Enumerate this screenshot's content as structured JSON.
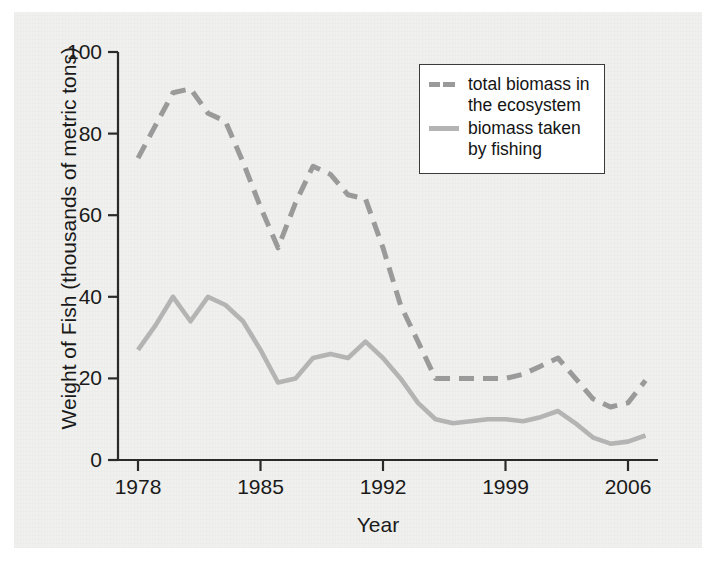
{
  "chart_data": {
    "type": "line",
    "title": "",
    "xlabel": "Year",
    "ylabel": "Weight of Fish (thousands of metric tons)",
    "xlim": [
      1978,
      2007
    ],
    "ylim": [
      0,
      100
    ],
    "xticks": [
      "1978",
      "1985",
      "1992",
      "1999",
      "2006"
    ],
    "xtick_values": [
      1978,
      1985,
      1992,
      1999,
      2006
    ],
    "yticks": [
      "0",
      "20",
      "40",
      "60",
      "80",
      "100"
    ],
    "ytick_values": [
      0,
      20,
      40,
      60,
      80,
      100
    ],
    "grid": false,
    "legend_position": "top-right",
    "x": [
      1978,
      1979,
      1980,
      1981,
      1982,
      1983,
      1984,
      1985,
      1986,
      1987,
      1988,
      1989,
      1990,
      1991,
      1992,
      1993,
      1994,
      1995,
      1996,
      1997,
      1998,
      1999,
      2000,
      2001,
      2002,
      2003,
      2004,
      2005,
      2006,
      2007
    ],
    "series": [
      {
        "name": "total biomass in the ecosystem",
        "style": "dashed",
        "color": "#9a9a9a",
        "values": [
          74,
          82,
          90,
          91,
          85,
          83,
          73,
          62,
          52,
          63,
          72,
          70,
          65,
          64,
          52,
          38,
          29,
          20,
          20,
          20,
          20,
          20,
          21,
          23,
          25,
          20,
          15,
          13,
          14,
          19.5
        ]
      },
      {
        "name": "biomass taken by fishing",
        "style": "solid",
        "color": "#b4b4b4",
        "values": [
          27,
          33,
          40,
          34,
          40,
          38,
          34,
          27,
          19,
          20,
          25,
          26,
          25,
          29,
          25,
          20,
          14,
          10,
          9,
          9.5,
          10,
          10,
          9.5,
          10.5,
          12,
          9,
          5.5,
          4,
          4.5,
          6
        ]
      }
    ]
  },
  "axes": {
    "y_title": "Weight of Fish (thousands of metric tons)",
    "x_title": "Year",
    "y_tick_labels": [
      "100",
      "80",
      "60",
      "40",
      "20",
      "0"
    ],
    "x_tick_labels": [
      "1978",
      "1985",
      "1992",
      "1999",
      "2006"
    ]
  },
  "legend": {
    "entries": [
      {
        "label_line1": "total biomass in",
        "label_line2": "the ecosystem",
        "style": "dashed"
      },
      {
        "label_line1": "biomass taken",
        "label_line2": "by fishing",
        "style": "solid"
      }
    ]
  }
}
